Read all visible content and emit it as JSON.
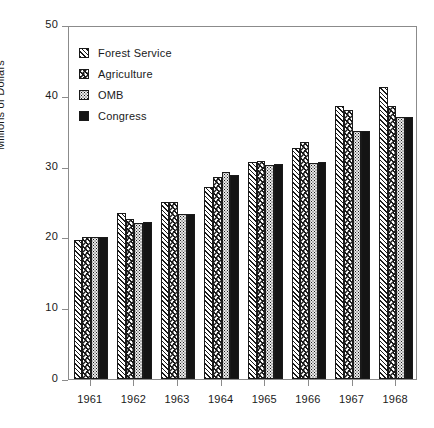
{
  "chart_data": {
    "type": "bar",
    "title": "",
    "subtitle": "",
    "xlabel": "",
    "ylabel": "Millions of Dollars",
    "categories": [
      "1961",
      "1962",
      "1963",
      "1964",
      "1965",
      "1966",
      "1967",
      "1968"
    ],
    "series": [
      {
        "name": "Forest Service",
        "pattern": "diagonal-hatch",
        "values": [
          19.7,
          23.5,
          25.0,
          27.1,
          30.6,
          32.6,
          38.5,
          41.2
        ]
      },
      {
        "name": "Agriculture",
        "pattern": "chevron-hatch",
        "values": [
          20.0,
          22.6,
          25.0,
          28.6,
          30.8,
          33.5,
          38.0,
          38.6
        ]
      },
      {
        "name": "OMB",
        "pattern": "stipple-dots",
        "values": [
          20.0,
          22.1,
          23.3,
          29.3,
          30.2,
          30.5,
          35.0,
          37.0
        ]
      },
      {
        "name": "Congress",
        "pattern": "solid-black",
        "values": [
          20.0,
          22.2,
          23.3,
          28.8,
          30.3,
          30.6,
          35.0,
          37.0
        ]
      }
    ],
    "ylim": [
      0,
      50
    ],
    "yticks": [
      0,
      10,
      20,
      30,
      40,
      50
    ],
    "ytick_labels": [
      "0",
      "10",
      "20",
      "30",
      "40",
      "50"
    ],
    "grid": false,
    "legend_position": "top-left",
    "legend_entries": [
      "Forest Service",
      "Agriculture",
      "OMB",
      "Congress"
    ],
    "colors": {
      "ink": "#1a1a1a",
      "frame": "#8b8b8b",
      "background": "#ffffff",
      "congress_fill": "#141414",
      "omb_fill": "#e9e9e9"
    }
  }
}
